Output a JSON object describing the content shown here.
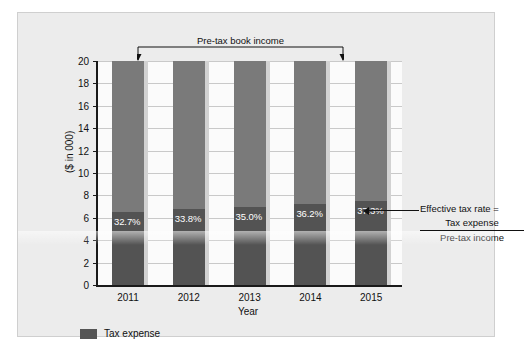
{
  "chart_data": {
    "type": "bar",
    "title": "",
    "subtitle": "",
    "xlabel": "Year",
    "ylabel": "($ in 000)",
    "ylim": [
      0,
      20
    ],
    "ytick_step": 2,
    "yticks": [
      "20",
      "18",
      "16",
      "14",
      "12",
      "10",
      "8",
      "6",
      "4",
      "2",
      "0"
    ],
    "grid": true,
    "stacked": true,
    "legend_position": "bottom-left",
    "categories": [
      "2011",
      "2012",
      "2013",
      "2014",
      "2015"
    ],
    "series": [
      {
        "name": "Tax expense",
        "color": "#535353",
        "values": [
          6.54,
          6.76,
          7.0,
          7.24,
          7.46
        ]
      },
      {
        "name": "Pre-tax book income remainder",
        "color": "#7a7a7a",
        "values": [
          13.46,
          13.24,
          13.0,
          12.76,
          12.54
        ]
      }
    ],
    "total_bar_value": 20,
    "data_labels": [
      "32.7%",
      "33.8%",
      "35.0%",
      "36.2%",
      "37.3%"
    ],
    "data_label_values": [
      32.7,
      33.8,
      35.0,
      36.2,
      37.3
    ],
    "annotations": [
      {
        "name": "pre-tax-book-income-bracket",
        "text": "Pre-tax book income",
        "position": "top",
        "spans_categories": [
          "2011",
          "2015"
        ]
      },
      {
        "name": "effective-tax-rate-formula",
        "line1": "Effective tax rate =",
        "numerator": "Tax expense",
        "denominator": "Pre-tax income",
        "position": "right",
        "points_to": "2015"
      }
    ]
  },
  "legend": {
    "items": [
      {
        "label": "Tax expense",
        "color": "#535353"
      }
    ]
  },
  "colors": {
    "panel_background": "#ececec",
    "plot_background": "#fbfbfb",
    "bar_upper": "#7a7a7a",
    "bar_lower": "#535353",
    "bar_shadow": "#d2d2d2",
    "axis": "#1a1a1a",
    "gridline": "#c9c9c9",
    "text": "#111111",
    "data_label_text": "#ffffff"
  }
}
